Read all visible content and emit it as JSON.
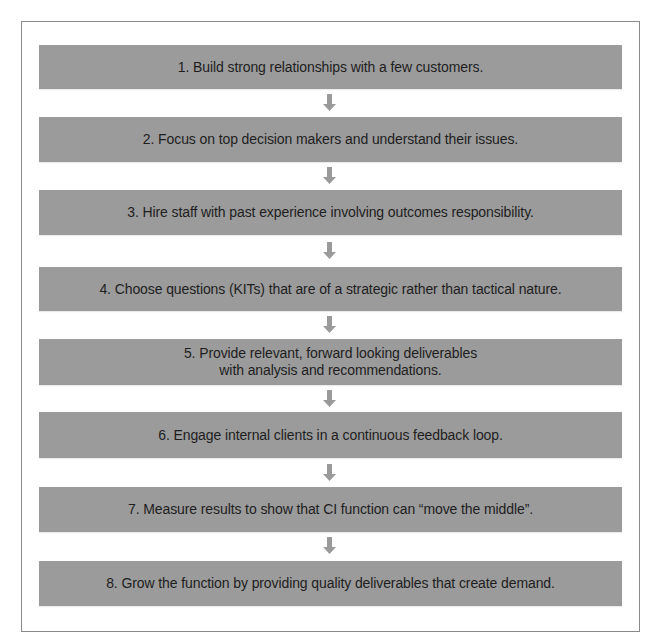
{
  "diagram": {
    "type": "vertical-flowchart",
    "box_color": "#9b9b9b",
    "arrow_color": "#9a9a9a",
    "text_color": "#1e1e1e",
    "steps": [
      {
        "label": "1. Build strong relationships with a few customers."
      },
      {
        "label": "2. Focus on top decision makers and understand their issues."
      },
      {
        "label": "3. Hire staff with past experience involving outcomes responsibility."
      },
      {
        "label": "4. Choose questions (KITs) that are of a strategic rather than tactical nature."
      },
      {
        "label": "5. Provide relevant, forward looking deliverables\nwith analysis and recommendations."
      },
      {
        "label": "6. Engage internal clients in a continuous feedback loop."
      },
      {
        "label": "7. Measure results to show that CI function can “move the middle”."
      },
      {
        "label": "8. Grow the function by providing quality deliverables that create demand."
      }
    ],
    "connectors": [
      {
        "from": 1,
        "to": 2,
        "icon": "down-arrow-icon"
      },
      {
        "from": 2,
        "to": 3,
        "icon": "down-arrow-icon"
      },
      {
        "from": 3,
        "to": 4,
        "icon": "down-arrow-icon"
      },
      {
        "from": 4,
        "to": 5,
        "icon": "down-arrow-icon"
      },
      {
        "from": 5,
        "to": 6,
        "icon": "down-arrow-icon"
      },
      {
        "from": 6,
        "to": 7,
        "icon": "down-arrow-icon"
      },
      {
        "from": 7,
        "to": 8,
        "icon": "down-arrow-icon"
      }
    ]
  }
}
